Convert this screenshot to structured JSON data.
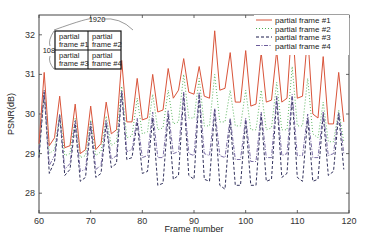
{
  "chart_data": {
    "type": "line",
    "title": "",
    "xlabel": "Frame number",
    "ylabel": "PSNR(dB)",
    "xlim": [
      60,
      120
    ],
    "ylim": [
      27.5,
      32.5
    ],
    "xticks": [
      60,
      70,
      80,
      90,
      100,
      110,
      120
    ],
    "yticks": [
      28,
      29,
      30,
      31,
      32
    ],
    "grid": false,
    "legend_position": "upper right",
    "x": [
      60,
      61,
      62,
      63,
      64,
      65,
      66,
      67,
      68,
      69,
      70,
      71,
      72,
      73,
      74,
      75,
      76,
      77,
      78,
      79,
      80,
      81,
      82,
      83,
      84,
      85,
      86,
      87,
      88,
      89,
      90,
      91,
      92,
      93,
      94,
      95,
      96,
      97,
      98,
      99,
      100,
      101,
      102,
      103,
      104,
      105,
      106,
      107,
      108,
      109,
      110,
      111,
      112,
      113,
      114,
      115,
      116,
      117,
      118,
      119
    ],
    "series": [
      {
        "name": "partial frame #1",
        "color": "#d9543a",
        "style": "solid",
        "values": [
          29.25,
          31.05,
          29.2,
          29.4,
          30.45,
          29.15,
          29.2,
          30.25,
          29.0,
          29.1,
          30.2,
          29.1,
          29.25,
          30.3,
          29.5,
          29.6,
          31.35,
          29.8,
          29.8,
          30.9,
          29.85,
          29.9,
          31.0,
          30.05,
          30.1,
          31.15,
          30.4,
          30.6,
          31.4,
          30.55,
          30.5,
          31.2,
          30.45,
          30.4,
          32.1,
          30.6,
          30.65,
          31.55,
          30.3,
          30.3,
          31.6,
          30.2,
          30.25,
          31.55,
          30.3,
          30.35,
          31.6,
          30.3,
          30.4,
          32.35,
          30.4,
          30.45,
          32.0,
          30.0,
          29.9,
          31.45,
          29.75,
          29.75,
          31.05,
          29.8
        ]
      },
      {
        "name": "partial frame #2",
        "color": "#4caf50",
        "style": "dotted",
        "values": [
          29.0,
          30.6,
          29.0,
          29.1,
          30.0,
          28.95,
          29.0,
          29.9,
          28.9,
          28.95,
          29.85,
          28.95,
          29.05,
          29.95,
          29.2,
          29.3,
          30.7,
          29.4,
          29.45,
          30.4,
          29.5,
          29.55,
          30.5,
          29.6,
          29.65,
          30.6,
          29.75,
          29.8,
          31.0,
          29.9,
          29.9,
          30.9,
          29.7,
          29.7,
          31.0,
          29.8,
          29.8,
          30.6,
          29.7,
          29.7,
          30.6,
          29.6,
          29.6,
          30.6,
          29.6,
          29.65,
          30.8,
          29.6,
          29.6,
          31.2,
          29.7,
          29.7,
          30.9,
          29.5,
          29.4,
          30.3,
          29.3,
          29.3,
          30.1,
          29.3
        ]
      },
      {
        "name": "partial frame #3",
        "color": "#1a1a4a",
        "style": "dashed",
        "values": [
          28.9,
          30.55,
          28.5,
          28.8,
          29.95,
          28.45,
          28.6,
          29.75,
          28.3,
          28.4,
          29.7,
          28.4,
          28.5,
          29.75,
          28.65,
          28.75,
          30.55,
          28.85,
          28.9,
          29.8,
          28.5,
          28.55,
          29.9,
          28.2,
          28.25,
          30.0,
          28.35,
          28.45,
          30.5,
          28.45,
          28.35,
          30.5,
          28.35,
          28.3,
          30.1,
          28.2,
          28.1,
          29.85,
          28.2,
          28.2,
          29.85,
          28.2,
          28.2,
          30.0,
          28.3,
          28.35,
          30.4,
          28.4,
          28.5,
          30.45,
          28.4,
          28.3,
          29.9,
          28.3,
          28.35,
          30.0,
          28.45,
          28.55,
          30.0,
          28.6
        ]
      },
      {
        "name": "partial frame #4",
        "color": "#6b5b9a",
        "style": "dash-dot",
        "values": [
          29.1,
          30.6,
          28.7,
          28.95,
          30.0,
          28.6,
          28.75,
          29.85,
          28.55,
          28.6,
          29.8,
          28.6,
          28.7,
          29.85,
          28.85,
          28.95,
          30.6,
          29.05,
          29.1,
          29.9,
          28.9,
          28.95,
          30.05,
          28.9,
          28.9,
          30.1,
          29.0,
          29.05,
          30.55,
          29.0,
          28.95,
          30.55,
          29.0,
          28.95,
          30.15,
          28.95,
          28.9,
          29.9,
          28.85,
          28.85,
          29.9,
          28.8,
          28.8,
          30.05,
          28.9,
          28.9,
          30.45,
          28.95,
          29.0,
          30.5,
          28.95,
          28.95,
          30.0,
          28.9,
          28.9,
          30.05,
          28.95,
          29.0,
          30.05,
          29.0
        ]
      }
    ],
    "annotations": {
      "inset_width_label": "1920",
      "inset_height_label": "1080",
      "inset_cells": [
        "partial frame #1",
        "partial frame #2",
        "partial frame #3",
        "partial frame #4"
      ]
    }
  }
}
